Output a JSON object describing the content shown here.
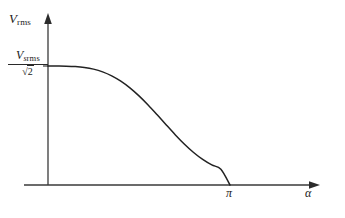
{
  "figure": {
    "background_color": "#ffffff",
    "line_color": "#222222",
    "axis_color": "#3a3a3a"
  },
  "axes": {
    "y_axis_label": "V",
    "y_axis_label_sub": "rms",
    "x_axis_label": "α",
    "x_tick_label": "π",
    "y_value_label": {
      "numerator_main": "V",
      "numerator_sub_s": "s",
      "numerator_sub_rms": "rms",
      "denominator_radical": "√",
      "denominator_radicand": "2"
    }
  },
  "chart_data": {
    "type": "line",
    "title": "",
    "xlabel": "α",
    "ylabel": "V rms",
    "xlim": [
      0,
      3.4557519
    ],
    "ylim": [
      0,
      0.8888889
    ],
    "grid": false,
    "legend": null,
    "x_tick_values": [
      3.1415927
    ],
    "x_tick_labels": [
      "π"
    ],
    "y_tick_values": [
      0.7071068
    ],
    "y_tick_labels": [
      "V s rms / √2"
    ],
    "annotations": [],
    "series": [
      {
        "name": "V rms vs firing angle",
        "description": "RMS output voltage of a phase-controlled converter versus firing angle alpha; equals (Vs rms/sqrt(2)) * sqrt(1 - alpha/pi + sin(2*alpha)/(2*pi))",
        "x": [
          0.0,
          0.1570796,
          0.3141593,
          0.4712389,
          0.6283185,
          0.7853982,
          0.9424778,
          1.0995574,
          1.2566371,
          1.4137167,
          1.5707963,
          1.727876,
          1.8849556,
          2.0420352,
          2.1991149,
          2.3561945,
          2.5132741,
          2.6703538,
          2.8274334,
          2.984513,
          3.1415927
        ],
        "y": [
          0.7071068,
          0.707018,
          0.7063098,
          0.7039252,
          0.698506,
          0.6884918,
          0.6723528,
          0.6488513,
          0.6172109,
          0.577266,
          0.5295796,
          0.4754977,
          0.417029,
          0.3567336,
          0.2974921,
          0.2421433,
          0.1930816,
          0.1518949,
          0.1190664,
          0.0938957,
          0.0
        ]
      }
    ]
  }
}
